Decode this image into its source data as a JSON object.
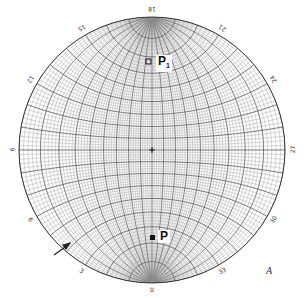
{
  "diagram": {
    "type": "stereographic-net",
    "figure_label": "A",
    "rim_labels": [
      {
        "text": "18",
        "angle": 0
      },
      {
        "text": "21",
        "angle": 30
      },
      {
        "text": "24",
        "angle": 60
      },
      {
        "text": "27",
        "angle": 90
      },
      {
        "text": "30",
        "angle": 120
      },
      {
        "text": "33",
        "angle": 150
      },
      {
        "text": "0",
        "angle": 180
      },
      {
        "text": "3",
        "angle": 210
      },
      {
        "text": "6",
        "angle": 240
      },
      {
        "text": "9",
        "angle": 270
      },
      {
        "text": "12",
        "angle": 300
      },
      {
        "text": "15",
        "angle": 330
      }
    ],
    "poles": [
      {
        "label": "P",
        "subscript": "1",
        "position": "upper"
      },
      {
        "label": "P",
        "subscript": "",
        "position": "lower"
      }
    ],
    "arrow": {
      "direction": "pointing up-right toward rim",
      "position": "lower-left"
    },
    "colors": {
      "grid": "#444444",
      "grid_light": "#9a9a9a",
      "background": "#ffffff",
      "marker": "#111111"
    }
  }
}
